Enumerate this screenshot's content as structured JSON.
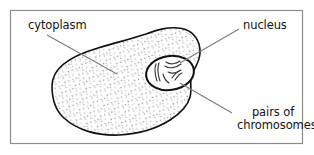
{
  "figure": {
    "background_color": "#ffffff",
    "frame_color": "#8c8c8c",
    "outline_color": "#111111",
    "leader_color": "#7d7d7d",
    "stipple_color": "#9a9a9a",
    "text_color": "#141414"
  },
  "labels": {
    "cytoplasm": "cytoplasm",
    "nucleus": "nucleus",
    "chromosomes_line1": "pairs of",
    "chromosomes_line2": "chromosomes"
  },
  "parts": {
    "cell_membrane": "cell-outline",
    "cytoplasm_fill": "stipple-pattern",
    "nucleus_shape": "ellipse",
    "chromosome_count": 6
  }
}
